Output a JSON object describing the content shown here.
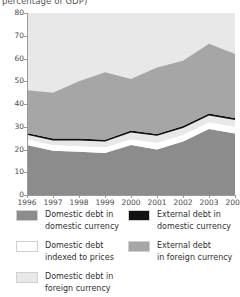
{
  "chart_title_clipped": "percentage of GDP)",
  "chart_data": {
    "type": "area",
    "title": "percentage of GDP)",
    "xlabel": "",
    "ylabel": "",
    "ylim": [
      0,
      80
    ],
    "yticks": [
      0,
      10,
      20,
      30,
      40,
      50,
      60,
      70,
      80
    ],
    "grid": false,
    "legend_position": "bottom",
    "stacked": true,
    "x": [
      1996,
      1997,
      1998,
      1999,
      2000,
      2001,
      2002,
      2003,
      2004
    ],
    "categories": [
      "1996",
      "1997",
      "1998",
      "1999",
      "2000",
      "2001",
      "2002",
      "2003",
      "2004"
    ],
    "series": [
      {
        "name": "Domestic debt in domestic currency",
        "color": "#8c8c8c",
        "values": [
          22.0,
          19.5,
          19.0,
          18.5,
          22.0,
          20.0,
          23.5,
          29.0,
          27.0
        ]
      },
      {
        "name": "Domestic debt indexed to prices",
        "color": "#ffffff",
        "values": [
          2.5,
          2.5,
          2.5,
          2.5,
          2.5,
          3.0,
          3.0,
          3.0,
          3.0
        ]
      },
      {
        "name": "Domestic debt in foreign currency",
        "color": "#e8e8e8",
        "values": [
          2.0,
          2.0,
          2.5,
          2.5,
          3.0,
          3.0,
          3.0,
          3.0,
          3.0
        ]
      },
      {
        "name": "External debt in domestic currency",
        "color": "#111111",
        "values": [
          0.8,
          0.8,
          0.8,
          0.8,
          0.8,
          0.8,
          0.8,
          0.8,
          0.8
        ]
      },
      {
        "name": "External debt in foreign currency",
        "color": "#a6a6a6",
        "values": [
          18.7,
          20.2,
          25.2,
          29.7,
          22.7,
          29.2,
          28.7,
          30.7,
          28.2
        ]
      }
    ],
    "stack_tops": {
      "domestic_domestic": [
        22.0,
        19.5,
        19.0,
        18.5,
        22.0,
        20.0,
        23.5,
        29.0,
        27.0
      ],
      "plus_indexed": [
        24.5,
        22.0,
        21.5,
        21.0,
        24.5,
        23.0,
        26.5,
        32.0,
        30.0
      ],
      "plus_dom_foreign": [
        26.5,
        24.0,
        24.0,
        23.5,
        27.5,
        26.0,
        29.5,
        35.0,
        33.0
      ],
      "plus_ext_domestic": [
        27.3,
        24.8,
        24.8,
        24.3,
        28.3,
        26.8,
        30.3,
        35.8,
        33.8
      ],
      "total": [
        46.0,
        45.0,
        50.0,
        54.0,
        51.0,
        56.0,
        59.0,
        66.5,
        62.0
      ]
    }
  },
  "yaxis": {
    "ticks": [
      "80",
      "70",
      "60",
      "50",
      "40",
      "30",
      "20",
      "10",
      "0"
    ]
  },
  "xaxis": {
    "ticks": [
      "1996",
      "1997",
      "1998",
      "1999",
      "2000",
      "2001",
      "2002",
      "2003",
      "2004"
    ]
  },
  "legend": {
    "items": [
      {
        "label": "Domestic debt in\ndomestic currency",
        "color": "#8c8c8c"
      },
      {
        "label": "External debt in\ndomestic currency",
        "color": "#111111"
      },
      {
        "label": "Domestic debt\nindexed to prices",
        "color": "#ffffff"
      },
      {
        "label": "External debt\nin foreign currency",
        "color": "#a6a6a6"
      },
      {
        "label": "Domestic debt in\nforeign currency",
        "color": "#e8e8e8"
      }
    ]
  }
}
